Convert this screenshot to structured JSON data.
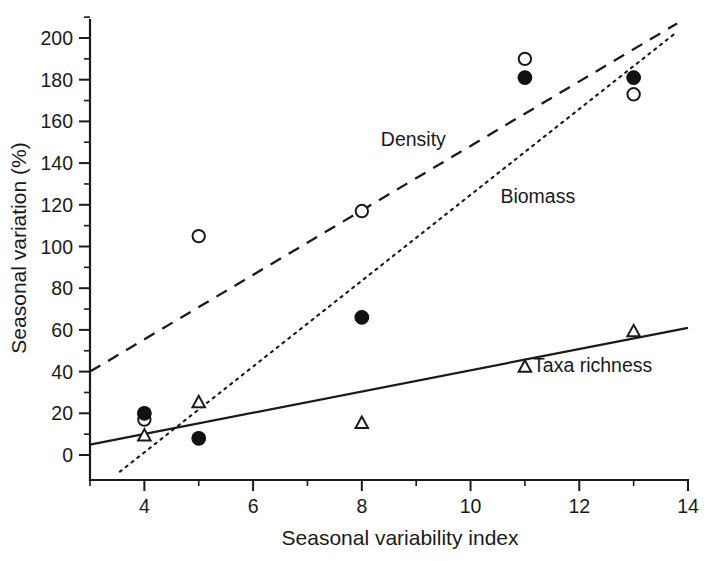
{
  "chart_data": {
    "type": "scatter",
    "title": "",
    "xlabel": "Seasonal variability index",
    "ylabel": "Seasonal variation (%)",
    "xlim": [
      3,
      14
    ],
    "ylim": [
      -8,
      208
    ],
    "grid": false,
    "legend_position": "inline-annotations",
    "x_ticks_major": [
      4,
      6,
      8,
      10,
      12,
      14
    ],
    "x_ticks_minor": [
      3,
      5,
      7,
      9,
      11,
      13
    ],
    "x_tick_labels": [
      "4",
      "6",
      "8",
      "10",
      "12",
      "14"
    ],
    "y_ticks_major": [
      0,
      20,
      40,
      60,
      80,
      100,
      120,
      140,
      160,
      180,
      200
    ],
    "y_ticks_minor": [
      10,
      30,
      50,
      70,
      90,
      110,
      130,
      150,
      170,
      190
    ],
    "y_tick_labels": [
      "0",
      "20",
      "40",
      "60",
      "80",
      "100",
      "120",
      "140",
      "160",
      "180",
      "200"
    ],
    "x": [
      4,
      5,
      8,
      11,
      13
    ],
    "series": [
      {
        "name": "Density",
        "marker": "open-circle",
        "line_style": "dashed",
        "values": [
          17,
          105,
          117,
          190,
          173
        ],
        "points": [
          {
            "x": 4,
            "y": 17
          },
          {
            "x": 5,
            "y": 105
          },
          {
            "x": 8,
            "y": 117
          },
          {
            "x": 11,
            "y": 190
          },
          {
            "x": 13,
            "y": 173
          }
        ],
        "fit_line": {
          "x0": 3,
          "y0": 40,
          "x1": 13.8,
          "y1": 207
        },
        "label_x": 8.35,
        "label_y": 148
      },
      {
        "name": "Biomass",
        "marker": "filled-circle",
        "line_style": "dotted",
        "values": [
          20,
          8,
          66,
          181,
          181
        ],
        "points": [
          {
            "x": 4,
            "y": 20
          },
          {
            "x": 5,
            "y": 8
          },
          {
            "x": 8,
            "y": 66
          },
          {
            "x": 11,
            "y": 181
          },
          {
            "x": 13,
            "y": 181
          }
        ],
        "fit_line": {
          "x0": 3.55,
          "y0": -8,
          "x1": 13.8,
          "y1": 203
        },
        "label_x": 10.55,
        "label_y": 121
      },
      {
        "name": "Taxa richness",
        "marker": "open-triangle",
        "line_style": "solid",
        "values": [
          9,
          25,
          15,
          42,
          59
        ],
        "points": [
          {
            "x": 4,
            "y": 9
          },
          {
            "x": 5,
            "y": 25
          },
          {
            "x": 8,
            "y": 15
          },
          {
            "x": 11,
            "y": 42
          },
          {
            "x": 13,
            "y": 59
          }
        ],
        "fit_line": {
          "x0": 3,
          "y0": 5,
          "x1": 14,
          "y1": 61
        },
        "label_x": 11.15,
        "label_y": 40
      }
    ]
  },
  "annotations": {
    "density_label": "Density",
    "biomass_label": "Biomass",
    "taxa_label": "Taxa richness"
  },
  "colors": {
    "ink": "#1a1a1a",
    "marker_fill": "#111111",
    "background": "#ffffff"
  }
}
